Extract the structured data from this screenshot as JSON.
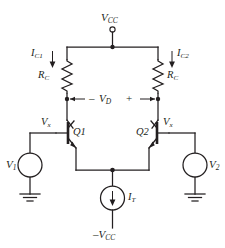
{
  "figure": {
    "kind": "circuit-schematic",
    "background_color": "#ffffff",
    "ink_color": "#231f20"
  },
  "labels": {
    "vcc_top": "V",
    "vcc_top_sub": "CC",
    "ic1": "I",
    "ic1_sub": "C1",
    "ic2": "I",
    "ic2_sub": "C2",
    "rc_left": "R",
    "rc_left_sub": "C",
    "rc_right": "R",
    "rc_right_sub": "C",
    "vd": "V",
    "vd_sub": "D",
    "vd_minus": "–",
    "vd_plus": "+",
    "vx_left": "V",
    "vx_left_sub": "x",
    "vx_right": "V",
    "vx_right_sub": "x",
    "q1": "Q1",
    "q2": "Q2",
    "v1": "V",
    "v1_sub": "1",
    "v2": "V",
    "v2_sub": "2",
    "it": "I",
    "it_sub": "T",
    "vee_bottom": "–V",
    "vee_bottom_sub": "CC"
  },
  "components": [
    {
      "name": "supply-terminal-vcc",
      "type": "open-terminal",
      "label": "VCC"
    },
    {
      "name": "resistor-rc-left",
      "type": "resistor",
      "label": "RC"
    },
    {
      "name": "resistor-rc-right",
      "type": "resistor",
      "label": "RC"
    },
    {
      "name": "transistor-q1",
      "type": "npn-bjt",
      "label": "Q1"
    },
    {
      "name": "transistor-q2",
      "type": "npn-bjt",
      "label": "Q2"
    },
    {
      "name": "source-v1",
      "type": "voltage-source",
      "label": "V1"
    },
    {
      "name": "source-v2",
      "type": "voltage-source",
      "label": "V2"
    },
    {
      "name": "current-source-it",
      "type": "current-source",
      "label": "IT"
    },
    {
      "name": "ground-left",
      "type": "ground"
    },
    {
      "name": "ground-right",
      "type": "ground"
    },
    {
      "name": "supply-terminal-vee",
      "type": "rail",
      "label": "-VCC"
    }
  ],
  "current_arrows": [
    {
      "name": "ic1-arrow",
      "label": "IC1",
      "direction": "down"
    },
    {
      "name": "ic2-arrow",
      "label": "IC2",
      "direction": "down"
    },
    {
      "name": "it-arrow",
      "label": "IT",
      "direction": "down"
    }
  ],
  "polarity": {
    "vd_left_sign": "–",
    "vd_right_sign": "+"
  }
}
